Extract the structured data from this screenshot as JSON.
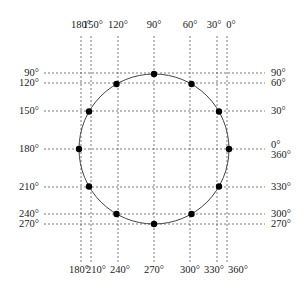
{
  "figure": {
    "circle": {
      "cx": 154,
      "cy": 149,
      "r": 75,
      "stroke": "#444444"
    },
    "point_color": "#000000",
    "grid_color": "#555555",
    "top_labels": [
      {
        "text": "180°",
        "x": 81
      },
      {
        "text": "150°",
        "x": 93
      },
      {
        "text": "120°",
        "x": 118
      },
      {
        "text": "90°",
        "x": 154
      },
      {
        "text": "60°",
        "x": 190
      },
      {
        "text": "30°",
        "x": 214
      },
      {
        "text": "0°",
        "x": 231
      }
    ],
    "bottom_labels": [
      {
        "text": "180°",
        "x": 79
      },
      {
        "text": "210°",
        "x": 96
      },
      {
        "text": "240°",
        "x": 120
      },
      {
        "text": "270°",
        "x": 154
      },
      {
        "text": "300°",
        "x": 190
      },
      {
        "text": "330°",
        "x": 214
      },
      {
        "text": "360°",
        "x": 238
      }
    ],
    "left_labels": [
      {
        "text": "90°",
        "y": 76
      },
      {
        "text": "120°",
        "y": 86
      },
      {
        "text": "150°",
        "y": 114
      },
      {
        "text": "180°",
        "y": 152
      },
      {
        "text": "210°",
        "y": 190
      },
      {
        "text": "240°",
        "y": 217
      },
      {
        "text": "270°",
        "y": 227
      }
    ],
    "right_labels": [
      {
        "text": "90°",
        "y": 76
      },
      {
        "text": "60°",
        "y": 86
      },
      {
        "text": "30°",
        "y": 114
      },
      {
        "text": "0°",
        "y": 148
      },
      {
        "text": "360°",
        "y": 158
      },
      {
        "text": "330°",
        "y": 190
      },
      {
        "text": "300°",
        "y": 217
      },
      {
        "text": "270°",
        "y": 227
      }
    ],
    "vertical_lines_x": [
      81,
      91,
      118,
      154,
      190,
      217,
      227
    ],
    "horizontal_lines_y": [
      73,
      83,
      111,
      149,
      187,
      214,
      224
    ],
    "points_deg": [
      0,
      30,
      60,
      90,
      120,
      150,
      180,
      210,
      240,
      270,
      300,
      330
    ]
  }
}
